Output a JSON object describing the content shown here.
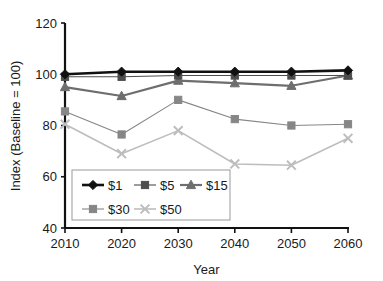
{
  "chart_data": {
    "type": "line",
    "title": "",
    "xlabel": "Year",
    "ylabel": "Index (Baseline = 100)",
    "categories": [
      2010,
      2020,
      2030,
      2040,
      2050,
      2060
    ],
    "x_tick_labels": [
      "2010",
      "2020",
      "2030",
      "2040",
      "2050",
      "2060"
    ],
    "y_tick_labels": [
      "40",
      "60",
      "80",
      "100",
      "120"
    ],
    "y_ticks": [
      40,
      60,
      80,
      100,
      120
    ],
    "ylim": [
      40,
      120
    ],
    "xlim": [
      2010,
      2060
    ],
    "grid": false,
    "legend_position": "inside-lower-left",
    "series": [
      {
        "name": "$1",
        "marker": "diamond",
        "color": "#111111",
        "line_width": 2.6,
        "values": [
          100,
          101,
          101,
          101,
          101,
          101.5
        ]
      },
      {
        "name": "$5",
        "marker": "square",
        "color": "#4d4d4d",
        "line_width": 1.1,
        "values": [
          99,
          99,
          99.5,
          99.5,
          99.5,
          99.5
        ]
      },
      {
        "name": "$15",
        "marker": "triangle",
        "color": "#6e6e6e",
        "line_width": 2.2,
        "values": [
          95,
          91.5,
          97.5,
          96.5,
          95.5,
          99.5
        ]
      },
      {
        "name": "$30",
        "marker": "square",
        "color": "#868686",
        "line_width": 1.1,
        "values": [
          85.5,
          76.5,
          90,
          82.5,
          80,
          80.5
        ]
      },
      {
        "name": "$50",
        "marker": "x",
        "color": "#bdbdbd",
        "line_width": 1.6,
        "values": [
          80.5,
          69,
          78,
          65,
          64.5,
          75
        ]
      }
    ]
  },
  "legend": {
    "entries": [
      "$1",
      "$5",
      "$15",
      "$30",
      "$50"
    ],
    "border_color": "#9a9a9a"
  },
  "axes": {
    "axis_color": "#111111"
  }
}
